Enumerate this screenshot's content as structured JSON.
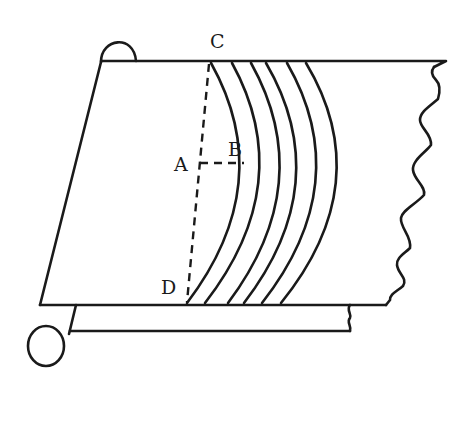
{
  "diagram": {
    "labels": {
      "C": "C",
      "A": "A",
      "B": "B",
      "D": "D"
    },
    "colors": {
      "stroke": "#1a1a1a",
      "background": "#ffffff"
    },
    "arc_count": 6
  }
}
